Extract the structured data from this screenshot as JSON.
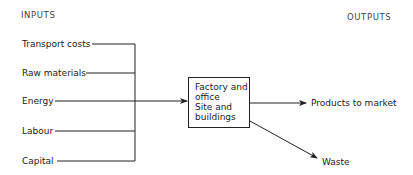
{
  "headers": {
    "inputs": "INPUTS",
    "outputs": "OUTPUTS"
  },
  "inputs": [
    {
      "label": "Transport costs"
    },
    {
      "label": "Raw materials"
    },
    {
      "label": "Energy"
    },
    {
      "label": "Labour"
    },
    {
      "label": "Capital"
    }
  ],
  "process_box": {
    "lines": [
      "Factory and",
      "office",
      "Site and",
      "buildings"
    ]
  },
  "outputs": [
    {
      "label": "Products to market"
    },
    {
      "label": "Waste"
    }
  ],
  "colors": {
    "line": "#222222",
    "text": "#222222",
    "background": "#ffffff"
  }
}
